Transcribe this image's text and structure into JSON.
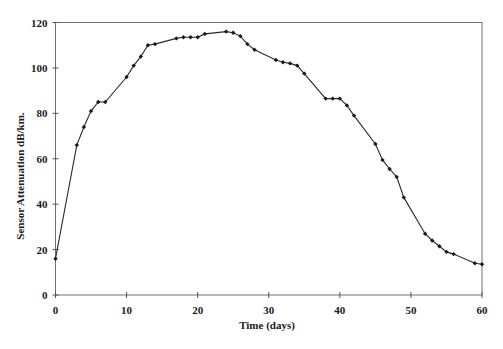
{
  "chart_data": {
    "type": "line",
    "title": "",
    "xlabel": "Time (days)",
    "ylabel": "Sensor Attenuation dB/km.",
    "xlim": [
      0,
      60
    ],
    "ylim": [
      0,
      120
    ],
    "x_ticks": [
      0,
      10,
      20,
      30,
      40,
      50,
      60
    ],
    "y_ticks": [
      0,
      20,
      40,
      60,
      80,
      100,
      120
    ],
    "grid": false,
    "legend": null,
    "frame": "box",
    "series": [
      {
        "name": "Sensor Attenuation",
        "marker": "diamond",
        "x": [
          0,
          3,
          4,
          5,
          6,
          7,
          10,
          11,
          12,
          13,
          14,
          17,
          18,
          19,
          20,
          21,
          24,
          25,
          26,
          27,
          28,
          31,
          32,
          33,
          34,
          35,
          38,
          39,
          40,
          41,
          42,
          45,
          46,
          47,
          48,
          49,
          52,
          53,
          54,
          55,
          56,
          59,
          60
        ],
        "values": [
          16,
          66,
          74,
          81,
          85,
          85,
          96,
          101,
          105,
          110,
          110.5,
          113,
          113.5,
          113.5,
          113.5,
          115,
          116,
          115.5,
          114,
          110.5,
          108,
          103.5,
          102.5,
          102,
          101,
          97.5,
          86.5,
          86.5,
          86.5,
          83.5,
          79,
          66.5,
          59.5,
          55.5,
          52,
          43,
          27,
          24,
          21.5,
          19,
          18,
          14,
          13.5
        ]
      }
    ]
  },
  "axes": {
    "x_title": "Time (days)",
    "y_title": "Sensor Attenuation dB/km.",
    "x_tick_labels": [
      "0",
      "10",
      "20",
      "30",
      "40",
      "50",
      "60"
    ],
    "y_tick_labels": [
      "0",
      "20",
      "40",
      "60",
      "80",
      "100",
      "120"
    ]
  },
  "colors": {
    "line": "#2a2a2a",
    "marker": "#1a1a1a",
    "frame": "#6e6e6e",
    "background": "#ffffff"
  }
}
